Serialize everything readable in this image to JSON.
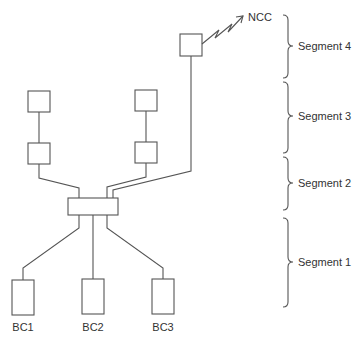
{
  "diagram": {
    "ncc_label": "NCC",
    "segments": [
      {
        "label": "Segment 4"
      },
      {
        "label": "Segment 3"
      },
      {
        "label": "Segment 2"
      },
      {
        "label": "Segment 1"
      }
    ],
    "bus_controllers": [
      {
        "label": "BC1"
      },
      {
        "label": "BC2"
      },
      {
        "label": "BC3"
      }
    ]
  }
}
